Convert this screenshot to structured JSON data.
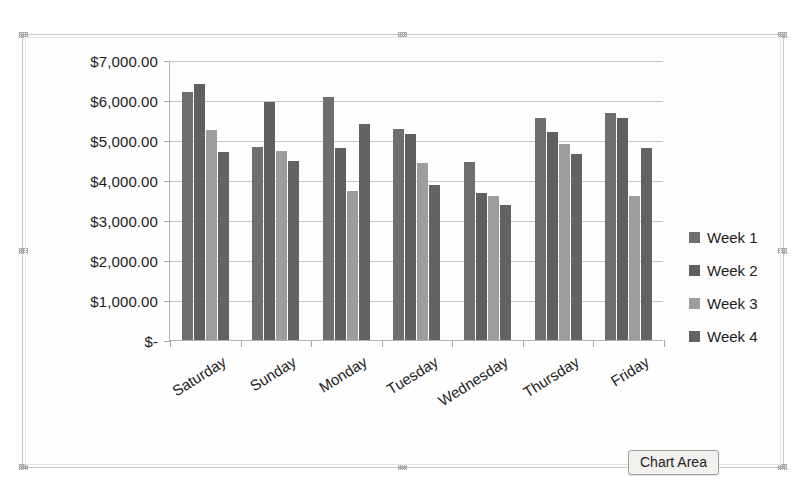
{
  "chart_data": {
    "type": "bar",
    "title": "",
    "xlabel": "",
    "ylabel": "",
    "ylim": [
      0,
      7000
    ],
    "ytick_step": 1000,
    "grid": true,
    "legend_position": "right",
    "categories": [
      "Saturday",
      "Sunday",
      "Monday",
      "Tuesday",
      "Wednesday",
      "Thursday",
      "Friday"
    ],
    "ytick_labels": [
      "$7,000.00",
      "$6,000.00",
      "$5,000.00",
      "$4,000.00",
      "$3,000.00",
      "$2,000.00",
      "$1,000.00",
      "$-"
    ],
    "ytick_values": [
      7000,
      6000,
      5000,
      4000,
      3000,
      2000,
      1000,
      0
    ],
    "series": [
      {
        "name": "Week 1",
        "color": "#6e6e6e",
        "values": [
          6200,
          4820,
          6080,
          5280,
          4450,
          5550,
          5680
        ]
      },
      {
        "name": "Week 2",
        "color": "#5f5f5f",
        "values": [
          6400,
          5950,
          4800,
          5150,
          3680,
          5200,
          5550
        ]
      },
      {
        "name": "Week 3",
        "color": "#9d9d9d",
        "values": [
          5250,
          4730,
          3720,
          4430,
          3600,
          4900,
          3600
        ]
      },
      {
        "name": "Week 4",
        "color": "#636363",
        "values": [
          4700,
          4480,
          5400,
          3870,
          3380,
          4650,
          4800
        ]
      }
    ]
  },
  "legend": {
    "items": [
      {
        "label": "Week 1"
      },
      {
        "label": "Week 2"
      },
      {
        "label": "Week 3"
      },
      {
        "label": "Week 4"
      }
    ]
  },
  "tooltip": {
    "chart_area_label": "Chart Area"
  }
}
